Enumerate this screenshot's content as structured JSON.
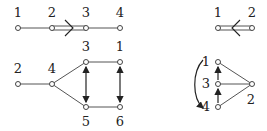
{
  "diagrams": [
    {
      "id": "top-left-path",
      "nodes": [
        {
          "label": "1",
          "x": 18,
          "y": 28,
          "lx": 18,
          "ly": 17
        },
        {
          "label": "2",
          "x": 52,
          "y": 28,
          "lx": 52,
          "ly": 17
        },
        {
          "label": "3",
          "x": 86,
          "y": 28,
          "lx": 86,
          "ly": 17
        },
        {
          "label": "4",
          "x": 120,
          "y": 28,
          "lx": 120,
          "ly": 17
        }
      ],
      "edges": [
        {
          "from": "1",
          "to": "2",
          "type": "single"
        },
        {
          "from": "2",
          "to": "3",
          "type": "double",
          "marker": ">"
        },
        {
          "from": "3",
          "to": "4",
          "type": "single"
        }
      ]
    },
    {
      "id": "bottom-left-graph",
      "nodes": [
        {
          "label": "2",
          "x": 18,
          "y": 84,
          "lx": 18,
          "ly": 73
        },
        {
          "label": "4",
          "x": 52,
          "y": 84,
          "lx": 52,
          "ly": 73
        },
        {
          "label": "3",
          "x": 86,
          "y": 62,
          "lx": 86,
          "ly": 51
        },
        {
          "label": "1",
          "x": 120,
          "y": 62,
          "lx": 120,
          "ly": 51
        },
        {
          "label": "5",
          "x": 86,
          "y": 107,
          "lx": 86,
          "ly": 126
        },
        {
          "label": "6",
          "x": 120,
          "y": 107,
          "lx": 120,
          "ly": 126
        }
      ],
      "edges": [
        {
          "from": "2",
          "to": "4",
          "type": "single"
        },
        {
          "from": "4",
          "to": "3",
          "type": "single"
        },
        {
          "from": "4",
          "to": "5",
          "type": "single"
        },
        {
          "from": "3",
          "to": "1",
          "type": "single"
        },
        {
          "from": "5",
          "to": "6",
          "type": "single"
        }
      ],
      "arrows": [
        {
          "between": [
            "3",
            "5"
          ],
          "type": "double-headed"
        },
        {
          "between": [
            "1",
            "6"
          ],
          "type": "double-headed"
        }
      ]
    },
    {
      "id": "top-right-pair",
      "nodes": [
        {
          "label": "1",
          "x": 218,
          "y": 28,
          "lx": 218,
          "ly": 17
        },
        {
          "label": "2",
          "x": 252,
          "y": 28,
          "lx": 252,
          "ly": 17
        }
      ],
      "edges": [
        {
          "from": "1",
          "to": "2",
          "type": "double",
          "marker": "<"
        }
      ]
    },
    {
      "id": "bottom-right-graph",
      "nodes": [
        {
          "label": "1",
          "x": 218,
          "y": 62,
          "lx": 206,
          "ly": 66
        },
        {
          "label": "3",
          "x": 218,
          "y": 84,
          "lx": 206,
          "ly": 88
        },
        {
          "label": "4",
          "x": 218,
          "y": 107,
          "lx": 206,
          "ly": 111
        },
        {
          "label": "2",
          "x": 252,
          "y": 84,
          "lx": 251,
          "ly": 104
        }
      ],
      "edges": [
        {
          "from": "1",
          "to": "2",
          "type": "single"
        },
        {
          "from": "3",
          "to": "2",
          "type": "single"
        },
        {
          "from": "4",
          "to": "2",
          "type": "single"
        }
      ],
      "arrows": [
        {
          "from": "3",
          "to": "1",
          "type": "up"
        },
        {
          "from": "4",
          "to": "3",
          "type": "up"
        },
        {
          "from": "1",
          "to": "4",
          "type": "curved-left"
        }
      ]
    }
  ]
}
